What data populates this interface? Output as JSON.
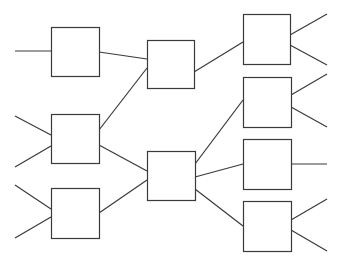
{
  "diagram": {
    "type": "network",
    "colors": {
      "background": "#ffffff",
      "stroke": "#3a3a3a"
    },
    "nodes": [
      {
        "id": "A",
        "layer": 0,
        "x": 51,
        "y": 27,
        "w": 48,
        "h": 49
      },
      {
        "id": "B",
        "layer": 0,
        "x": 51,
        "y": 114,
        "w": 48,
        "h": 49
      },
      {
        "id": "C",
        "layer": 0,
        "x": 51,
        "y": 188,
        "w": 48,
        "h": 50
      },
      {
        "id": "D",
        "layer": 1,
        "x": 147,
        "y": 40,
        "w": 47,
        "h": 48
      },
      {
        "id": "E",
        "layer": 1,
        "x": 147,
        "y": 151,
        "w": 48,
        "h": 49
      },
      {
        "id": "F",
        "layer": 2,
        "x": 243,
        "y": 14,
        "w": 47,
        "h": 50
      },
      {
        "id": "G",
        "layer": 2,
        "x": 243,
        "y": 77,
        "w": 48,
        "h": 50
      },
      {
        "id": "H",
        "layer": 2,
        "x": 243,
        "y": 139,
        "w": 48,
        "h": 50
      },
      {
        "id": "I",
        "layer": 2,
        "x": 243,
        "y": 201,
        "w": 48,
        "h": 50
      }
    ],
    "edges": [
      {
        "from": "input",
        "to": "A",
        "x1": 15,
        "y1": 51,
        "x2": 51,
        "y2": 51
      },
      {
        "from": "input",
        "to": "B",
        "x1": 15,
        "y1": 116,
        "x2": 51,
        "y2": 135
      },
      {
        "from": "input",
        "to": "B",
        "x1": 15,
        "y1": 167,
        "x2": 51,
        "y2": 146
      },
      {
        "from": "input",
        "to": "C",
        "x1": 15,
        "y1": 185,
        "x2": 51,
        "y2": 209
      },
      {
        "from": "input",
        "to": "C",
        "x1": 15,
        "y1": 238,
        "x2": 51,
        "y2": 217
      },
      {
        "from": "A",
        "to": "D",
        "x1": 99,
        "y1": 52,
        "x2": 147,
        "y2": 59
      },
      {
        "from": "B",
        "to": "D",
        "x1": 99,
        "y1": 130,
        "x2": 147,
        "y2": 68
      },
      {
        "from": "B",
        "to": "E",
        "x1": 99,
        "y1": 145,
        "x2": 147,
        "y2": 171
      },
      {
        "from": "C",
        "to": "E",
        "x1": 99,
        "y1": 213,
        "x2": 147,
        "y2": 180
      },
      {
        "from": "D",
        "to": "F",
        "x1": 194,
        "y1": 72,
        "x2": 243,
        "y2": 42
      },
      {
        "from": "E",
        "to": "G",
        "x1": 195,
        "y1": 164,
        "x2": 243,
        "y2": 100
      },
      {
        "from": "E",
        "to": "H",
        "x1": 195,
        "y1": 177,
        "x2": 243,
        "y2": 164
      },
      {
        "from": "E",
        "to": "I",
        "x1": 195,
        "y1": 189,
        "x2": 243,
        "y2": 226
      },
      {
        "from": "F",
        "to": "output",
        "x1": 290,
        "y1": 35,
        "x2": 327,
        "y2": 14
      },
      {
        "from": "F",
        "to": "output",
        "x1": 290,
        "y1": 45,
        "x2": 327,
        "y2": 65
      },
      {
        "from": "G",
        "to": "output",
        "x1": 291,
        "y1": 95,
        "x2": 327,
        "y2": 74
      },
      {
        "from": "G",
        "to": "output",
        "x1": 291,
        "y1": 107,
        "x2": 327,
        "y2": 127
      },
      {
        "from": "H",
        "to": "output",
        "x1": 291,
        "y1": 164,
        "x2": 327,
        "y2": 164
      },
      {
        "from": "I",
        "to": "output",
        "x1": 291,
        "y1": 220,
        "x2": 327,
        "y2": 199
      },
      {
        "from": "I",
        "to": "output",
        "x1": 291,
        "y1": 230,
        "x2": 327,
        "y2": 251
      }
    ]
  }
}
